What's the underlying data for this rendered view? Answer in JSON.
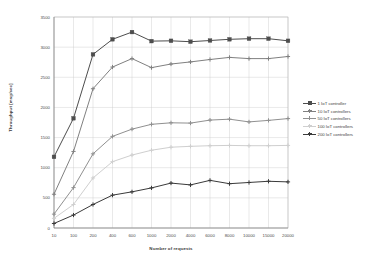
{
  "chart_data": {
    "type": "line",
    "title": "",
    "xlabel": "Number of requests",
    "ylabel": "Throughput [msg/sec]",
    "categories": [
      "10",
      "100",
      "200",
      "400",
      "600",
      "1000",
      "2000",
      "4000",
      "6000",
      "8000",
      "10000",
      "15000",
      "20000"
    ],
    "ylim": [
      0,
      3500
    ],
    "yticks": [
      "0",
      "500",
      "1000",
      "1500",
      "2000",
      "2500",
      "3000",
      "3500"
    ],
    "grid": true,
    "legend_position": "right",
    "series": [
      {
        "name": "1 IoT controller",
        "color": "#4d4d4d",
        "marker": "square",
        "values": [
          1180,
          1820,
          2880,
          3130,
          3250,
          3100,
          3105,
          3090,
          3110,
          3130,
          3140,
          3140,
          3105
        ]
      },
      {
        "name": "10 IoT controllers",
        "color": "#808080",
        "marker": "plus",
        "values": [
          560,
          1270,
          2310,
          2670,
          2810,
          2660,
          2720,
          2755,
          2795,
          2830,
          2810,
          2810,
          2845
        ]
      },
      {
        "name": "50 IoT controllers",
        "color": "#909090",
        "marker": "plus",
        "values": [
          230,
          670,
          1230,
          1520,
          1640,
          1720,
          1745,
          1740,
          1790,
          1805,
          1760,
          1785,
          1815
        ]
      },
      {
        "name": "100 IoT controllers",
        "color": "#cfcfcf",
        "marker": "plus",
        "values": [
          160,
          390,
          830,
          1100,
          1210,
          1290,
          1340,
          1355,
          1365,
          1370,
          1365,
          1365,
          1370
        ]
      },
      {
        "name": "200 IoT controllers",
        "color": "#3a3a3a",
        "marker": "plus",
        "values": [
          75,
          215,
          390,
          545,
          600,
          665,
          745,
          715,
          790,
          735,
          755,
          775,
          765
        ]
      }
    ]
  }
}
